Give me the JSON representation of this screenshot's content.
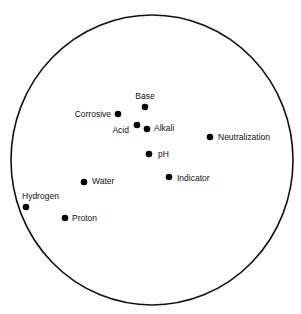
{
  "diagram": {
    "type": "concept-map",
    "boundary": {
      "cx": 152,
      "cy": 160,
      "rx": 141,
      "ry": 145,
      "stroke": "#111111"
    },
    "dot_color": "#000000",
    "terms": [
      {
        "label": "Base",
        "x": 145,
        "y": 107,
        "lx": 145,
        "ly": 99,
        "anchor": "middle"
      },
      {
        "label": "Corrosive",
        "x": 118,
        "y": 114,
        "lx": 111,
        "ly": 117,
        "anchor": "end"
      },
      {
        "label": "Acid",
        "x": 137,
        "y": 125,
        "lx": 129,
        "ly": 133,
        "anchor": "end"
      },
      {
        "label": "Alkali",
        "x": 147,
        "y": 129,
        "lx": 154,
        "ly": 131,
        "anchor": "start"
      },
      {
        "label": "Neutralization",
        "x": 210,
        "y": 137,
        "lx": 218,
        "ly": 140,
        "anchor": "start"
      },
      {
        "label": "pH",
        "x": 149,
        "y": 154,
        "lx": 158,
        "ly": 157,
        "anchor": "start"
      },
      {
        "label": "Indicator",
        "x": 169,
        "y": 177,
        "lx": 177,
        "ly": 181,
        "anchor": "start"
      },
      {
        "label": "Water",
        "x": 84,
        "y": 182,
        "lx": 92,
        "ly": 184,
        "anchor": "start"
      },
      {
        "label": "Hydrogen",
        "x": 26,
        "y": 207,
        "lx": 22,
        "ly": 199,
        "anchor": "start"
      },
      {
        "label": "Proton",
        "x": 65,
        "y": 218,
        "lx": 72,
        "ly": 221,
        "anchor": "start"
      }
    ]
  }
}
